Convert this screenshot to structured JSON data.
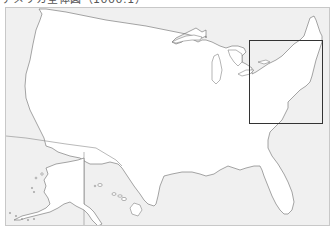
{
  "title": "アメリカ全体図（1000:1）",
  "map": {
    "region": "United States (contiguous, Alaska, Hawaii)",
    "colors": {
      "land": "#ffffff",
      "water": "#f0f0f0",
      "outline": "#6a6a6a",
      "inset_box": "#333333",
      "frame_border": "#c8c8c8"
    },
    "highlight": {
      "label": "Northeast inset",
      "area": "New England / Mid-Atlantic"
    },
    "components": [
      "contiguous-us",
      "alaska",
      "hawaii",
      "great-lakes"
    ]
  }
}
